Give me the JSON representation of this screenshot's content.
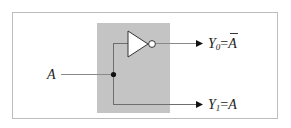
{
  "diagram": {
    "colors": {
      "frame": "#bdbdbd",
      "block_fill": "#c4c4c4",
      "wire": "#6e6e6e",
      "gate_fill": "#ffffff",
      "gate_stroke": "#333333",
      "text": "#222222"
    },
    "input": {
      "label": "A"
    },
    "outputs": [
      {
        "label_main": "Y",
        "label_sub": "0",
        "label_eq": "=",
        "label_var": "A",
        "inverted": true
      },
      {
        "label_main": "Y",
        "label_sub": "1",
        "label_eq": "=",
        "label_var": "A",
        "inverted": false
      }
    ],
    "gate": {
      "type": "NOT"
    }
  }
}
